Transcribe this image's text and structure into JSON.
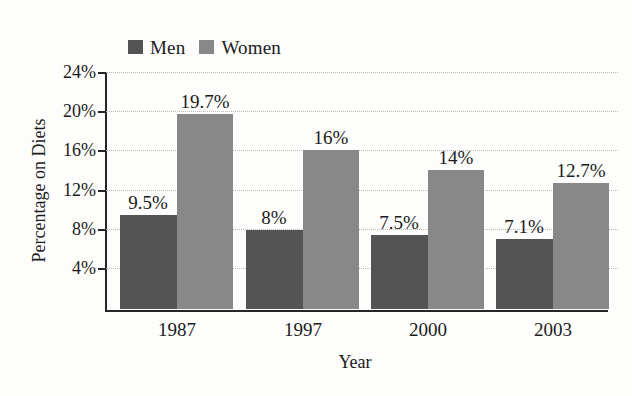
{
  "chart_data": {
    "type": "bar",
    "title": "",
    "xlabel": "Year",
    "ylabel": "Percentage on Diets",
    "categories": [
      "1987",
      "1997",
      "2000",
      "2003"
    ],
    "series": [
      {
        "name": "Men",
        "color": "#545454",
        "values": [
          9.5,
          8,
          7.5,
          7.1
        ],
        "labels": [
          "9.5%",
          "8%",
          "7.5%",
          "7.1%"
        ]
      },
      {
        "name": "Women",
        "color": "#888888",
        "values": [
          19.7,
          16,
          14,
          12.7
        ],
        "labels": [
          "19.7%",
          "16%",
          "14%",
          "12.7%"
        ]
      }
    ],
    "ylim": [
      0,
      26
    ],
    "yticks": [
      4,
      8,
      12,
      16,
      20,
      24
    ],
    "ytick_labels": [
      "4%",
      "8%",
      "12%",
      "16%",
      "20%",
      "24%"
    ],
    "grid": true,
    "legend_position": "top-left"
  },
  "legend": {
    "men_label": "Men",
    "women_label": "Women"
  },
  "axes": {
    "y_title": "Percentage on Diets",
    "x_title": "Year",
    "y_tick_0": "4%",
    "y_tick_1": "8%",
    "y_tick_2": "12%",
    "y_tick_3": "16%",
    "y_tick_4": "20%",
    "y_tick_5": "24%",
    "x_tick_0": "1987",
    "x_tick_1": "1997",
    "x_tick_2": "2000",
    "x_tick_3": "2003"
  },
  "bar_labels": {
    "men_1987": "9.5%",
    "women_1987": "19.7%",
    "men_1997": "8%",
    "women_1997": "16%",
    "men_2000": "7.5%",
    "women_2000": "14%",
    "men_2003": "7.1%",
    "women_2003": "12.7%"
  }
}
